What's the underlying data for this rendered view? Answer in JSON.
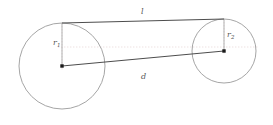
{
  "figure": {
    "type": "geometry-diagram",
    "background_color": "#ffffff",
    "width": 273,
    "height": 125,
    "labels": {
      "tangent_length": "l",
      "center_distance": "d",
      "radius_left_letter": "r",
      "radius_left_sub": "1",
      "radius_right_letter": "r",
      "radius_right_sub": "2"
    },
    "colors": {
      "circle_stroke": "#9b9b9b",
      "solid_line": "#4d4d4d",
      "radius_line": "#a8a8a8",
      "guide_dotted": "#e9d9d9",
      "center_dot": "#1a1a1a",
      "label_text": "#555555"
    },
    "shapes": {
      "left_circle": {
        "cx": 62,
        "cy": 66,
        "r": 43
      },
      "right_circle": {
        "cx": 224,
        "cy": 51,
        "r": 32
      },
      "tangent_line": {
        "x1": 62,
        "y1": 23,
        "x2": 224,
        "y2": 19
      },
      "center_line": {
        "x1": 62,
        "y1": 66,
        "x2": 224,
        "y2": 51
      },
      "left_radius_line": {
        "x1": 62,
        "y1": 23,
        "x2": 62,
        "y2": 66
      },
      "right_radius_line": {
        "x1": 224,
        "y1": 19,
        "x2": 224,
        "y2": 51
      },
      "guide_horizontal": {
        "x1": 58,
        "y1": 47,
        "x2": 258,
        "y2": 47
      },
      "guide_vertical_left": {
        "x1": 62,
        "y1": 23,
        "x2": 62,
        "y2": 70
      },
      "guide_vertical_right": {
        "x1": 224,
        "y1": 19,
        "x2": 224,
        "y2": 55
      }
    },
    "label_positions": {
      "tangent_length": {
        "left": 141,
        "top": 8
      },
      "center_distance": {
        "left": 141,
        "top": 73
      },
      "radius_left": {
        "left": 53,
        "top": 39
      },
      "radius_right": {
        "left": 227,
        "top": 31
      }
    }
  }
}
